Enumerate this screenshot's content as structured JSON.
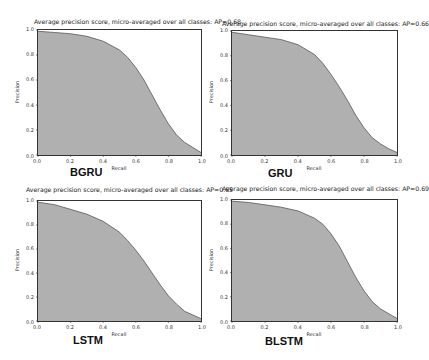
{
  "chart_data": [
    {
      "type": "area",
      "name": "BGRU",
      "title": "Average precision score, micro-averaged over all classes: AP=0.68",
      "xlabel": "Recall",
      "ylabel": "Precision",
      "xlim": [
        0.0,
        1.0
      ],
      "ylim": [
        0.0,
        1.0
      ],
      "xticks": [
        "0.0",
        "0.2",
        "0.4",
        "0.6",
        "0.8",
        "1.0"
      ],
      "yticks": [
        "0.0",
        "0.2",
        "0.4",
        "0.6",
        "0.8",
        "1.0"
      ],
      "grid": false,
      "fill_color": "#b0b0b0",
      "x": [
        0.0,
        0.1,
        0.2,
        0.3,
        0.4,
        0.5,
        0.55,
        0.6,
        0.65,
        0.7,
        0.75,
        0.8,
        0.85,
        0.9,
        0.95,
        1.0
      ],
      "y": [
        0.99,
        0.98,
        0.97,
        0.95,
        0.91,
        0.84,
        0.78,
        0.7,
        0.6,
        0.48,
        0.36,
        0.25,
        0.16,
        0.1,
        0.06,
        0.02
      ]
    },
    {
      "type": "area",
      "name": "GRU",
      "title": "Average precision score, micro-averaged over all classes: AP=0.66",
      "xlabel": "Recall",
      "ylabel": "Precision",
      "xlim": [
        0.0,
        1.0
      ],
      "ylim": [
        0.0,
        1.0
      ],
      "xticks": [
        "0.0",
        "0.2",
        "0.4",
        "0.6",
        "0.8",
        "1.0"
      ],
      "yticks": [
        "0.0",
        "0.2",
        "0.4",
        "0.6",
        "0.8",
        "1.0"
      ],
      "grid": false,
      "fill_color": "#b0b0b0",
      "x": [
        0.0,
        0.1,
        0.2,
        0.3,
        0.4,
        0.5,
        0.55,
        0.6,
        0.65,
        0.7,
        0.75,
        0.8,
        0.85,
        0.9,
        0.95,
        1.0
      ],
      "y": [
        0.99,
        0.97,
        0.95,
        0.93,
        0.89,
        0.81,
        0.74,
        0.65,
        0.55,
        0.44,
        0.32,
        0.22,
        0.14,
        0.09,
        0.05,
        0.02
      ]
    },
    {
      "type": "area",
      "name": "LSTM",
      "title": "Average precision score, micro-averaged over all classes: AP=0.65",
      "xlabel": "Recall",
      "ylabel": "Precision",
      "xlim": [
        0.0,
        1.0
      ],
      "ylim": [
        0.0,
        1.0
      ],
      "xticks": [
        "0.0",
        "0.2",
        "0.4",
        "0.6",
        "0.8",
        "1.0"
      ],
      "yticks": [
        "0.0",
        "0.2",
        "0.4",
        "0.6",
        "0.8",
        "1.0"
      ],
      "grid": false,
      "fill_color": "#b0b0b0",
      "x": [
        0.0,
        0.1,
        0.2,
        0.3,
        0.4,
        0.5,
        0.55,
        0.6,
        0.65,
        0.7,
        0.75,
        0.8,
        0.85,
        0.9,
        0.95,
        1.0
      ],
      "y": [
        0.99,
        0.97,
        0.93,
        0.89,
        0.83,
        0.74,
        0.67,
        0.59,
        0.5,
        0.4,
        0.3,
        0.21,
        0.14,
        0.08,
        0.05,
        0.02
      ]
    },
    {
      "type": "area",
      "name": "BLSTM",
      "title": "Average precision score, micro-averaged over all classes: AP=0.69",
      "xlabel": "Recall",
      "ylabel": "Precision",
      "xlim": [
        0.0,
        1.0
      ],
      "ylim": [
        0.0,
        1.0
      ],
      "xticks": [
        "0.0",
        "0.2",
        "0.4",
        "0.6",
        "0.8",
        "1.0"
      ],
      "yticks": [
        "0.0",
        "0.2",
        "0.4",
        "0.6",
        "0.8",
        "1.0"
      ],
      "grid": false,
      "fill_color": "#b0b0b0",
      "x": [
        0.0,
        0.1,
        0.2,
        0.3,
        0.4,
        0.5,
        0.55,
        0.6,
        0.65,
        0.7,
        0.75,
        0.8,
        0.85,
        0.9,
        0.95,
        1.0
      ],
      "y": [
        0.99,
        0.98,
        0.96,
        0.94,
        0.91,
        0.85,
        0.8,
        0.72,
        0.62,
        0.49,
        0.36,
        0.25,
        0.16,
        0.1,
        0.06,
        0.02
      ]
    }
  ],
  "panels": [
    {
      "name": "BGRU",
      "title": "Average precision score, micro-averaged over all classes: AP=0.68",
      "xlabel": "Recall",
      "ylabel": "Precision"
    },
    {
      "name": "GRU",
      "title": "Average precision score, micro-averaged over all classes: AP=0.66",
      "xlabel": "Recall",
      "ylabel": "Precision"
    },
    {
      "name": "LSTM",
      "title": "Average precision score, micro-averaged over all classes: AP=0.65",
      "xlabel": "Recall",
      "ylabel": "Precision"
    },
    {
      "name": "BLSTM",
      "title": "Average precision score, micro-averaged over all classes: AP=0.69",
      "xlabel": "Recall",
      "ylabel": "Precision"
    }
  ],
  "ticks": [
    "0.0",
    "0.2",
    "0.4",
    "0.6",
    "0.8",
    "1.0"
  ],
  "colors": {
    "fill": "#b0b0b0",
    "line": "#555555",
    "frame": "#333333"
  }
}
